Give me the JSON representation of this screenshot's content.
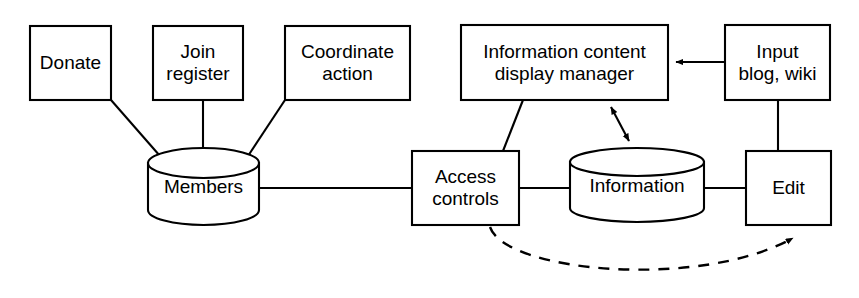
{
  "diagram": {
    "type": "block-flow-diagram",
    "stroke_color": "#000000",
    "fill_color": "#ffffff",
    "text_color": "#000000",
    "nodes": [
      {
        "id": "donate",
        "label": "Donate",
        "shape": "rectangle",
        "x": 30,
        "y": 26,
        "w": 81,
        "h": 74
      },
      {
        "id": "join",
        "label": "Join\nregister",
        "shape": "rectangle",
        "x": 153,
        "y": 26,
        "w": 90,
        "h": 74
      },
      {
        "id": "coord",
        "label": "Coordinate\naction",
        "shape": "rectangle",
        "x": 285,
        "y": 26,
        "w": 125,
        "h": 74
      },
      {
        "id": "manager",
        "label": "Information content\ndisplay manager",
        "shape": "rectangle",
        "x": 461,
        "y": 25,
        "w": 207,
        "h": 75
      },
      {
        "id": "input",
        "label": "Input\nblog, wiki",
        "shape": "rectangle",
        "x": 725,
        "y": 25,
        "w": 105,
        "h": 75
      },
      {
        "id": "members",
        "label": "Members",
        "shape": "cylinder",
        "x": 148,
        "y": 148,
        "w": 111,
        "h": 77
      },
      {
        "id": "access",
        "label": "Access\ncontrols",
        "shape": "rectangle",
        "x": 412,
        "y": 151,
        "w": 107,
        "h": 74
      },
      {
        "id": "info",
        "label": "Information",
        "shape": "cylinder",
        "x": 570,
        "y": 148,
        "w": 134,
        "h": 74
      },
      {
        "id": "edit",
        "label": "Edit",
        "shape": "rectangle",
        "x": 746,
        "y": 151,
        "w": 85,
        "h": 74
      }
    ],
    "edges": [
      {
        "id": "donate-members",
        "from": "donate",
        "to": "members",
        "style": "solid",
        "arrow": "none"
      },
      {
        "id": "join-members",
        "from": "join",
        "to": "members",
        "style": "solid",
        "arrow": "none"
      },
      {
        "id": "coord-members",
        "from": "coord",
        "to": "members",
        "style": "solid",
        "arrow": "none"
      },
      {
        "id": "members-access",
        "from": "members",
        "to": "access",
        "style": "solid",
        "arrow": "none"
      },
      {
        "id": "manager-access",
        "from": "manager",
        "to": "access",
        "style": "solid",
        "arrow": "none"
      },
      {
        "id": "manager-info",
        "from": "manager",
        "to": "info",
        "style": "solid",
        "arrow": "both"
      },
      {
        "id": "input-manager",
        "from": "input",
        "to": "manager",
        "style": "solid",
        "arrow": "single"
      },
      {
        "id": "input-edit",
        "from": "input",
        "to": "edit",
        "style": "solid",
        "arrow": "none"
      },
      {
        "id": "access-info",
        "from": "access",
        "to": "info",
        "style": "solid",
        "arrow": "none"
      },
      {
        "id": "info-edit",
        "from": "info",
        "to": "edit",
        "style": "solid",
        "arrow": "none"
      },
      {
        "id": "access-edit",
        "from": "access",
        "to": "edit",
        "style": "dashed",
        "arrow": "single"
      }
    ]
  }
}
